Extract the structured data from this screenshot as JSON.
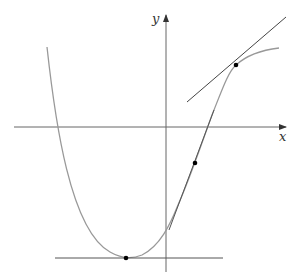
{
  "diagram": {
    "axes": {
      "x_label": "x",
      "y_label": "y"
    },
    "curve": "polynomial-like curve with a minimum and inflection, with three tangent lines",
    "points": [
      {
        "name": "minimum",
        "x": 126,
        "y": 258
      },
      {
        "name": "mid",
        "x": 195,
        "y": 163
      },
      {
        "name": "upper",
        "x": 236,
        "y": 65
      }
    ],
    "colors": {
      "curve": "#999999",
      "axes": "#666666",
      "tangent": "#444444",
      "point": "#000000"
    }
  }
}
